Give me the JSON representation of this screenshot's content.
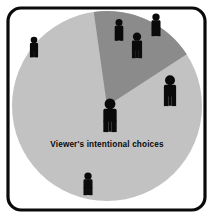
{
  "figure": {
    "width": 214,
    "height": 219,
    "background_color": "#ffffff"
  },
  "frame": {
    "name": "rounded-border-frame",
    "stroke_color": "#0a0a0a",
    "stroke_width": 3.2,
    "corner_radius": 13,
    "x": 8,
    "y": 8,
    "width": 197,
    "height": 202
  },
  "label": {
    "text": "Viewer's intentional choices",
    "color": "#0a0a0a",
    "x": 107,
    "y": 147
  },
  "chart_data": {
    "type": "pie",
    "title": "Viewer's intentional choices",
    "center_x": 107,
    "center_y": 106,
    "radius": 95,
    "legend": "none",
    "grid": false,
    "categories": [
      "Unattended majority",
      "Intentional choices wedge"
    ],
    "values": [
      82,
      18
    ],
    "slices": [
      {
        "name": "base-slice",
        "label": "Unattended majority",
        "value": 82,
        "color": "#c2c2c2",
        "start_angle_deg": 57,
        "end_angle_deg": 352
      },
      {
        "name": "highlight-wedge",
        "label": "Intentional choices wedge",
        "value": 18,
        "color": "#8b8b8b",
        "start_angle_deg": 352,
        "end_angle_deg": 57
      }
    ]
  },
  "figures": [
    {
      "name": "person-figure-center",
      "x": 110,
      "y": 120,
      "scale": 1.55,
      "color": "#0a0a0a",
      "region": "center"
    },
    {
      "name": "person-figure-left",
      "x": 34,
      "y": 50,
      "scale": 0.95,
      "color": "#0a0a0a",
      "region": "light-slice"
    },
    {
      "name": "person-figure-bottom",
      "x": 88,
      "y": 187,
      "scale": 1.05,
      "color": "#0a0a0a",
      "region": "light-slice"
    },
    {
      "name": "person-figure-right",
      "x": 170,
      "y": 95,
      "scale": 1.42,
      "color": "#0a0a0a",
      "region": "light-slice"
    },
    {
      "name": "person-figure-top-right",
      "x": 156,
      "y": 28,
      "scale": 1.05,
      "color": "#0a0a0a",
      "region": "light-slice"
    },
    {
      "name": "person-figure-wedge-left",
      "x": 119,
      "y": 33,
      "scale": 1.0,
      "color": "#0a0a0a",
      "region": "highlight-wedge"
    },
    {
      "name": "person-figure-wedge-right",
      "x": 137,
      "y": 49,
      "scale": 1.18,
      "color": "#0a0a0a",
      "region": "highlight-wedge"
    }
  ]
}
